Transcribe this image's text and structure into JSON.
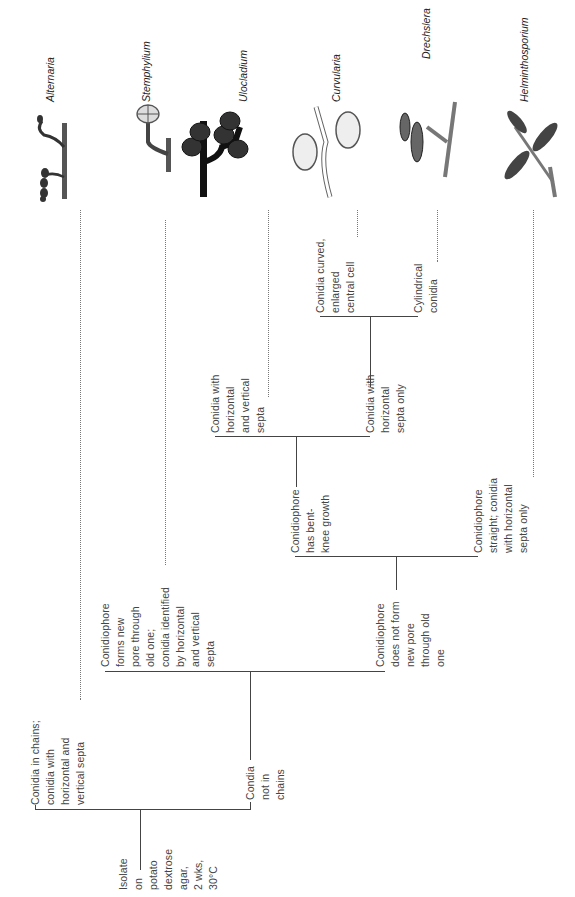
{
  "root": {
    "label": "Isolate\non\npotato\ndextrose\nagar,\n2 wks,\n30°C"
  },
  "nodes": {
    "chains": "Conidia in chains;\nconidia with\nhorizontal and\nvertical septa",
    "not_chains": "Condia\nnot in\nchains",
    "new_pore": "Conidiophore\nforms new\npore through\nold one;\nconidia identified\nby horizontal\nand vertical\nsepta",
    "no_new_pore": "Conidiophore\ndoes not form\nnew pore\nthrough old\none",
    "bent_knee": "Conidiophore\nhas bent-\nknee growth",
    "straight": "Conidiophore\nstraight; conidia\nwith horizontal\nsepta only",
    "horiz_vert": "Conidia with\nhorizontal\nand vertical\nsepta",
    "horiz_only": "Conidia with\nhorizontal\nsepta only",
    "curved": "Conidia curved,\nenlarged\ncentral cell",
    "cylindrical": "Cylindrical\nconidia"
  },
  "genera": [
    {
      "name": "Alternaria",
      "icon": "alternaria-illustration"
    },
    {
      "name": "Stemphylium",
      "icon": "stemphylium-illustration"
    },
    {
      "name": "Ulocladium",
      "icon": "ulocladium-illustration"
    },
    {
      "name": "Curvularia",
      "icon": "curvularia-illustration"
    },
    {
      "name": "Drechslera",
      "icon": "drechslera-illustration"
    },
    {
      "name": "Helminthosporium",
      "icon": "helminthosporium-illustration"
    }
  ]
}
